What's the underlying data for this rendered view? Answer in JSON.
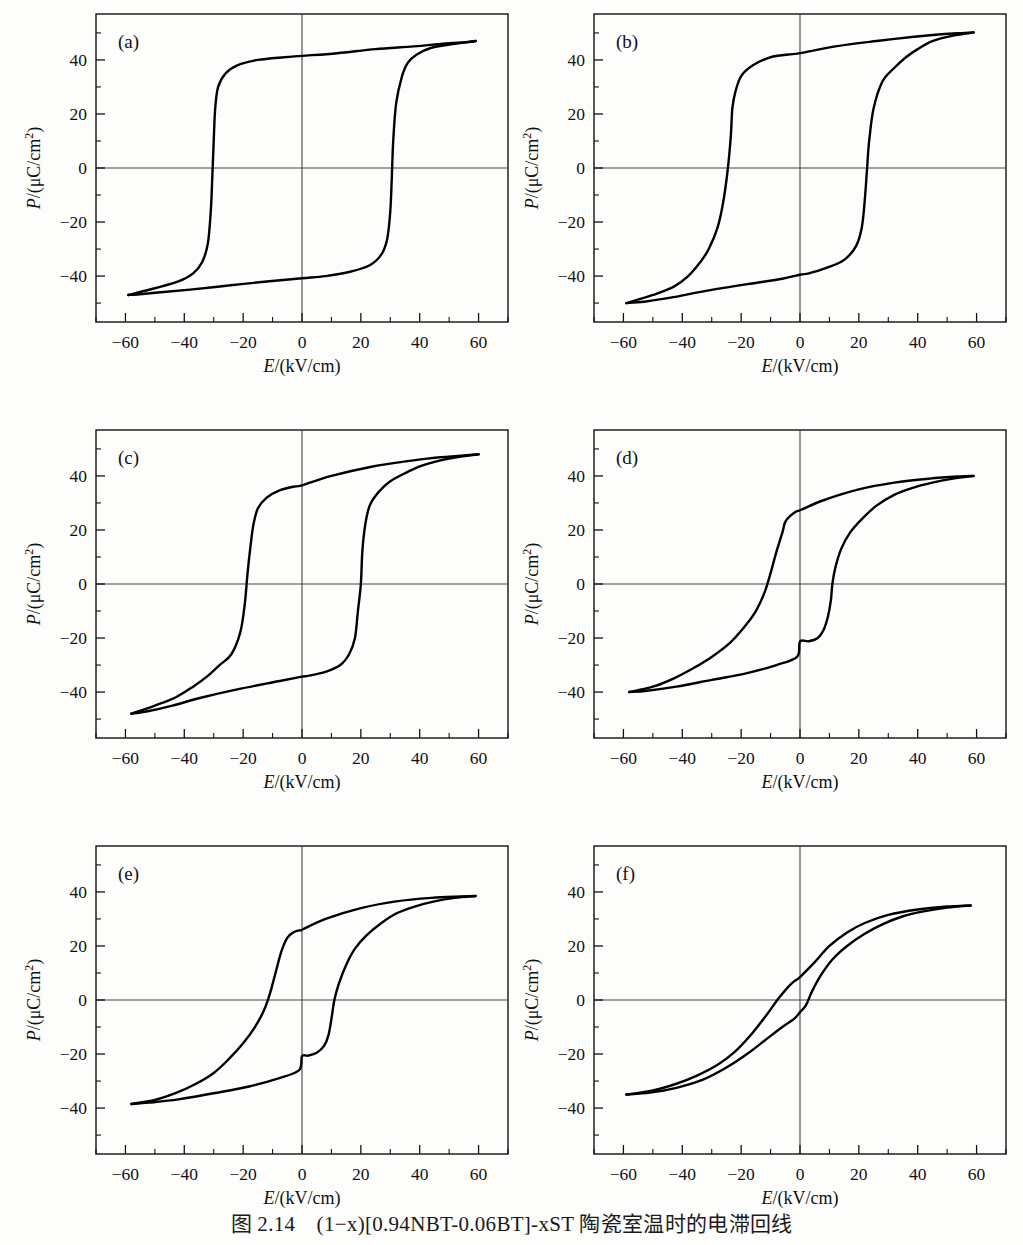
{
  "figure": {
    "caption_prefix": "图 2.14",
    "caption_text": "(1−x)[0.94NBT-0.06BT]-xST 陶瓷室温时的电滞回线",
    "caption_full": "图 2.14　(1−x)[0.94NBT-0.06BT]-xST 陶瓷室温时的电滞回线",
    "panel_count": 6
  },
  "axes": {
    "xlabel": "E/(kV/cm)",
    "ylabel": "P/(μC/cm²)",
    "xticks": [
      -60,
      -40,
      -20,
      0,
      20,
      40,
      60
    ],
    "yticks": [
      40,
      20,
      0,
      -20,
      -40
    ],
    "xtick_labels": [
      "−60",
      "−40",
      "−20",
      "0",
      "20",
      "40",
      "60"
    ],
    "ytick_labels": [
      "40",
      "20",
      "0",
      "−20",
      "−40"
    ],
    "xlim": [
      -70,
      70
    ],
    "ylim": [
      -57,
      57
    ],
    "grid": false,
    "zero_axis_lines": true
  },
  "chart_data": {
    "type": "line",
    "xlabel": "E/(kV/cm)",
    "ylabel": "P/(μC/cm²)",
    "xlim": [
      -70,
      70
    ],
    "ylim": [
      -57,
      57
    ],
    "panels": [
      {
        "label": "(a)",
        "description": "square ferroelectric loop, largest coercive field",
        "Pmax": 47,
        "Pr": 41,
        "Ec": 30,
        "upper_branch": [
          [
            -59,
            -47
          ],
          [
            -50,
            -44.5
          ],
          [
            -42,
            -42
          ],
          [
            -37,
            -39
          ],
          [
            -34,
            -35
          ],
          [
            -32,
            -28
          ],
          [
            -31,
            -16
          ],
          [
            -30.5,
            -4
          ],
          [
            -30,
            10
          ],
          [
            -29.5,
            22
          ],
          [
            -28.5,
            30
          ],
          [
            -26,
            35
          ],
          [
            -22,
            38
          ],
          [
            -15,
            40
          ],
          [
            -6,
            41
          ],
          [
            0,
            41.5
          ],
          [
            12,
            42.5
          ],
          [
            25,
            44
          ],
          [
            38,
            45
          ],
          [
            48,
            46
          ],
          [
            56,
            46.6
          ],
          [
            59,
            47
          ]
        ],
        "lower_branch": [
          [
            59,
            47
          ],
          [
            52,
            46
          ],
          [
            44,
            44.5
          ],
          [
            39,
            42
          ],
          [
            36,
            39
          ],
          [
            34,
            34
          ],
          [
            32,
            24
          ],
          [
            31,
            10
          ],
          [
            30.5,
            -4
          ],
          [
            30,
            -16
          ],
          [
            29,
            -26
          ],
          [
            27,
            -32
          ],
          [
            23,
            -36
          ],
          [
            16,
            -38.5
          ],
          [
            8,
            -40
          ],
          [
            0,
            -40.8
          ],
          [
            -12,
            -42
          ],
          [
            -25,
            -43.5
          ],
          [
            -38,
            -45
          ],
          [
            -48,
            -46
          ],
          [
            -56,
            -46.8
          ],
          [
            -59,
            -47
          ]
        ]
      },
      {
        "label": "(b)",
        "description": "square ferroelectric loop, slightly higher Pmax, smaller Ec",
        "Pmax": 50,
        "Pr": 42,
        "Ec": 22,
        "upper_branch": [
          [
            -59,
            -50
          ],
          [
            -50,
            -47
          ],
          [
            -43,
            -44
          ],
          [
            -38,
            -40
          ],
          [
            -34,
            -35
          ],
          [
            -31,
            -30
          ],
          [
            -28,
            -22
          ],
          [
            -26,
            -12
          ],
          [
            -24.5,
            0
          ],
          [
            -23.5,
            12
          ],
          [
            -23,
            22
          ],
          [
            -22,
            28
          ],
          [
            -20,
            34
          ],
          [
            -16,
            38
          ],
          [
            -10,
            41
          ],
          [
            -4,
            42
          ],
          [
            0,
            42.5
          ],
          [
            12,
            45
          ],
          [
            26,
            47
          ],
          [
            38,
            48.5
          ],
          [
            48,
            49.5
          ],
          [
            56,
            50
          ],
          [
            59,
            50.2
          ]
        ],
        "lower_branch": [
          [
            59,
            50.2
          ],
          [
            52,
            49
          ],
          [
            45,
            47
          ],
          [
            40,
            44
          ],
          [
            36,
            41
          ],
          [
            32,
            37
          ],
          [
            28,
            32
          ],
          [
            25,
            22
          ],
          [
            23.5,
            10
          ],
          [
            22.8,
            0
          ],
          [
            22,
            -12
          ],
          [
            21,
            -22
          ],
          [
            19,
            -29
          ],
          [
            15,
            -34
          ],
          [
            9,
            -37
          ],
          [
            3,
            -39
          ],
          [
            0,
            -39.5
          ],
          [
            -6,
            -41
          ],
          [
            -18,
            -43
          ],
          [
            -32,
            -45.5
          ],
          [
            -44,
            -48
          ],
          [
            -53,
            -49.5
          ],
          [
            -59,
            -50
          ]
        ]
      },
      {
        "label": "(c)",
        "description": "ferroelectric loop with rounded tips, reduced remanence",
        "Pmax": 48,
        "Pr": 36,
        "Ec": 20,
        "upper_branch": [
          [
            -58,
            -48
          ],
          [
            -50,
            -45
          ],
          [
            -43,
            -42
          ],
          [
            -37,
            -38
          ],
          [
            -32,
            -34
          ],
          [
            -28,
            -30
          ],
          [
            -24,
            -26
          ],
          [
            -21,
            -18
          ],
          [
            -19.5,
            -8
          ],
          [
            -18.5,
            4
          ],
          [
            -17.5,
            14
          ],
          [
            -16.5,
            22
          ],
          [
            -15,
            28
          ],
          [
            -12,
            32
          ],
          [
            -8,
            34.5
          ],
          [
            -3,
            36
          ],
          [
            0,
            36.5
          ],
          [
            10,
            40
          ],
          [
            24,
            43.5
          ],
          [
            36,
            45.5
          ],
          [
            46,
            46.8
          ],
          [
            55,
            47.6
          ],
          [
            60,
            48
          ]
        ],
        "lower_branch": [
          [
            60,
            48
          ],
          [
            53,
            47
          ],
          [
            46,
            45.5
          ],
          [
            40,
            43.5
          ],
          [
            35,
            41
          ],
          [
            30,
            38
          ],
          [
            26,
            34
          ],
          [
            23,
            29
          ],
          [
            21.5,
            22
          ],
          [
            20.5,
            12
          ],
          [
            20,
            0
          ],
          [
            19,
            -10
          ],
          [
            18,
            -20
          ],
          [
            16,
            -26
          ],
          [
            13,
            -30
          ],
          [
            8,
            -32.5
          ],
          [
            2,
            -34
          ],
          [
            0,
            -34.3
          ],
          [
            -8,
            -36
          ],
          [
            -22,
            -39
          ],
          [
            -34,
            -42
          ],
          [
            -44,
            -45
          ],
          [
            -52,
            -47
          ],
          [
            -58,
            -48
          ]
        ]
      },
      {
        "label": "(d)",
        "description": "pinched / constricted slim loop, antiferroelectric-like",
        "Pmax": 40,
        "Pr": 27,
        "Ec": 11,
        "upper_branch": [
          [
            -58,
            -40
          ],
          [
            -50,
            -38
          ],
          [
            -43,
            -35
          ],
          [
            -36,
            -31
          ],
          [
            -30,
            -27
          ],
          [
            -24,
            -22
          ],
          [
            -19,
            -16
          ],
          [
            -15,
            -10
          ],
          [
            -12,
            -3
          ],
          [
            -10,
            4
          ],
          [
            -8,
            12
          ],
          [
            -6,
            19
          ],
          [
            -5,
            23
          ],
          [
            -3,
            25.5
          ],
          [
            -1,
            27
          ],
          [
            0,
            27.3
          ],
          [
            8,
            31
          ],
          [
            20,
            35
          ],
          [
            32,
            37.5
          ],
          [
            44,
            39
          ],
          [
            54,
            39.8
          ],
          [
            59,
            40
          ]
        ],
        "lower_branch": [
          [
            59,
            40
          ],
          [
            52,
            39
          ],
          [
            45,
            37.5
          ],
          [
            38,
            35.5
          ],
          [
            32,
            33
          ],
          [
            26,
            29
          ],
          [
            21,
            24
          ],
          [
            17,
            19
          ],
          [
            14,
            13
          ],
          [
            12,
            6
          ],
          [
            11,
            0
          ],
          [
            10.5,
            -6
          ],
          [
            9.5,
            -12
          ],
          [
            8,
            -17
          ],
          [
            6,
            -20
          ],
          [
            3,
            -21.2
          ],
          [
            0,
            -21.3
          ],
          [
            -1,
            -27
          ],
          [
            -8,
            -30
          ],
          [
            -18,
            -33
          ],
          [
            -30,
            -35.5
          ],
          [
            -42,
            -38
          ],
          [
            -52,
            -39.5
          ],
          [
            -58,
            -40
          ]
        ]
      },
      {
        "label": "(e)",
        "description": "pinched slim loop, slightly lower Pmax than (d)",
        "Pmax": 38.5,
        "Pr": 26,
        "Ec": 10,
        "upper_branch": [
          [
            -58,
            -38.5
          ],
          [
            -50,
            -37
          ],
          [
            -43,
            -34.5
          ],
          [
            -36,
            -31
          ],
          [
            -30,
            -27
          ],
          [
            -25,
            -22
          ],
          [
            -20,
            -16
          ],
          [
            -16,
            -10
          ],
          [
            -13,
            -4
          ],
          [
            -11,
            2
          ],
          [
            -9,
            10
          ],
          [
            -7,
            18
          ],
          [
            -5,
            23
          ],
          [
            -3,
            25
          ],
          [
            -1,
            25.8
          ],
          [
            0,
            26
          ],
          [
            8,
            30
          ],
          [
            20,
            34
          ],
          [
            32,
            36.5
          ],
          [
            44,
            37.8
          ],
          [
            54,
            38.3
          ],
          [
            59,
            38.5
          ]
        ],
        "lower_branch": [
          [
            59,
            38.5
          ],
          [
            52,
            37.8
          ],
          [
            45,
            36.5
          ],
          [
            38,
            34.5
          ],
          [
            32,
            32
          ],
          [
            27,
            28.5
          ],
          [
            22,
            24
          ],
          [
            18,
            19
          ],
          [
            15,
            13
          ],
          [
            12.5,
            6
          ],
          [
            11,
            0
          ],
          [
            10,
            -7
          ],
          [
            9,
            -13
          ],
          [
            7.5,
            -17
          ],
          [
            5,
            -19.5
          ],
          [
            2,
            -20.6
          ],
          [
            0,
            -20.8
          ],
          [
            -1,
            -26
          ],
          [
            -8,
            -29
          ],
          [
            -18,
            -32
          ],
          [
            -30,
            -34.5
          ],
          [
            -42,
            -36.8
          ],
          [
            -52,
            -38
          ],
          [
            -58,
            -38.5
          ]
        ]
      },
      {
        "label": "(f)",
        "description": "very slim relaxor-like loop, near-zero remanence",
        "Pmax": 35,
        "Pr": 8,
        "Ec": 6,
        "upper_branch": [
          [
            -59,
            -35
          ],
          [
            -50,
            -33.5
          ],
          [
            -42,
            -31
          ],
          [
            -35,
            -28
          ],
          [
            -28,
            -24
          ],
          [
            -22,
            -19
          ],
          [
            -16,
            -12
          ],
          [
            -11,
            -5
          ],
          [
            -7,
            1
          ],
          [
            -3,
            6
          ],
          [
            0,
            8.5
          ],
          [
            5,
            14
          ],
          [
            10,
            20
          ],
          [
            16,
            25
          ],
          [
            22,
            28.5
          ],
          [
            30,
            31.5
          ],
          [
            40,
            33.5
          ],
          [
            50,
            34.6
          ],
          [
            58,
            35
          ]
        ],
        "lower_branch": [
          [
            58,
            35
          ],
          [
            50,
            34.2
          ],
          [
            42,
            32.8
          ],
          [
            35,
            31
          ],
          [
            28,
            28
          ],
          [
            22,
            24.5
          ],
          [
            16,
            20
          ],
          [
            11,
            15
          ],
          [
            7,
            9
          ],
          [
            4,
            3
          ],
          [
            2,
            -2
          ],
          [
            0,
            -4.5
          ],
          [
            -2,
            -7
          ],
          [
            -6,
            -10
          ],
          [
            -12,
            -15
          ],
          [
            -18,
            -20
          ],
          [
            -25,
            -25
          ],
          [
            -33,
            -29.5
          ],
          [
            -42,
            -32.5
          ],
          [
            -51,
            -34.3
          ],
          [
            -59,
            -35
          ]
        ]
      }
    ]
  }
}
